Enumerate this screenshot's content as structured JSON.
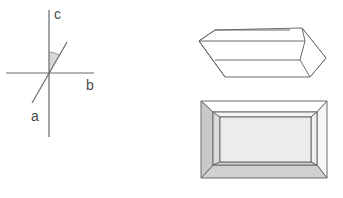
{
  "diagram": {
    "axes": {
      "labels": {
        "c": "c",
        "b": "b",
        "a": "a"
      },
      "c_axis": {
        "x1": 49,
        "y1": 10,
        "x2": 49,
        "y2": 137
      },
      "b_axis": {
        "x1": 6,
        "y1": 73,
        "x2": 94,
        "y2": 73
      },
      "a_axis": {
        "x1": 32,
        "y1": 103,
        "x2": 67,
        "y2": 42
      },
      "angle_wedge_color": "#d8d8d8",
      "line_color": "#6a6a6a"
    },
    "prism_crystal": {
      "name": "elongated prism",
      "stroke": "#6a6a6a"
    },
    "tabular_crystal": {
      "name": "tabular crystal (top view)",
      "outer_face_dark": "#c9c9c9",
      "inner_face": "#ececec",
      "stroke": "#6a6a6a"
    }
  }
}
